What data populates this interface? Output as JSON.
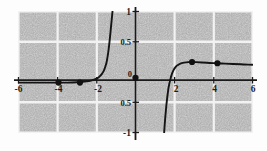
{
  "figure": {
    "title": "",
    "background_color": "#ffffff",
    "plot_background_color": "#a9a9a9",
    "grid_color": "#ffffff",
    "axis_color": "#1a1a1a",
    "curve_color": "#1a1a1a",
    "point_color": "#111111"
  },
  "chart_data": {
    "type": "line",
    "title": "",
    "subtitle": "",
    "xlabel": "",
    "ylabel": "",
    "xlim": [
      -6,
      6
    ],
    "ylim": [
      -1,
      1
    ],
    "grid": true,
    "grid_x_lines": [
      -6,
      -4,
      -2,
      0,
      2,
      4,
      6
    ],
    "grid_y_lines": [
      -1,
      -0.5,
      0,
      0.5,
      1
    ],
    "legend": null,
    "legend_position": "none",
    "xticks": [
      -6,
      -4,
      -2,
      2,
      4,
      6
    ],
    "xtick_labels": [
      "-6",
      "-4",
      "-2",
      "2",
      "4",
      "6"
    ],
    "yticks": [
      -1,
      -0.5,
      0.5,
      1
    ],
    "ytick_labels": [
      "-1",
      "0.5",
      "0.5",
      "1"
    ],
    "origin_label": "0",
    "vertical_asymptotes": [
      -1.15,
      1.45
    ],
    "series": [
      {
        "name": "branch-left",
        "comment": "left branch: flat near y=-0.17 from x=-6, rising steeply to +1 at asymptote x=-1.15",
        "x": [
          -6.0,
          -5.5,
          -5.0,
          -4.5,
          -4.0,
          -3.5,
          -3.0,
          -2.8,
          -2.6,
          -2.4,
          -2.2,
          -2.0,
          -1.9,
          -1.8,
          -1.7,
          -1.6,
          -1.5,
          -1.45,
          -1.4,
          -1.35,
          -1.3,
          -1.27,
          -1.24,
          -1.21,
          -1.18
        ],
        "y": [
          -0.175,
          -0.175,
          -0.175,
          -0.175,
          -0.175,
          -0.175,
          -0.17,
          -0.165,
          -0.16,
          -0.15,
          -0.135,
          -0.11,
          -0.09,
          -0.06,
          -0.02,
          0.04,
          0.14,
          0.22,
          0.32,
          0.45,
          0.6,
          0.7,
          0.8,
          0.9,
          1.0
        ]
      },
      {
        "name": "branch-right",
        "comment": "right branch: from -1 at asymptote x=1.45 rising to plateau y~0.16 then slow decay to y~0.12 at x=6",
        "x": [
          1.47,
          1.5,
          1.54,
          1.58,
          1.62,
          1.66,
          1.7,
          1.78,
          1.86,
          1.95,
          2.05,
          2.15,
          2.3,
          2.5,
          2.7,
          2.9,
          3.1,
          3.4,
          3.8,
          4.2,
          4.6,
          5.0,
          5.4,
          5.8,
          6.0
        ],
        "y": [
          -1.0,
          -0.86,
          -0.7,
          -0.56,
          -0.44,
          -0.34,
          -0.25,
          -0.13,
          -0.04,
          0.03,
          0.08,
          0.11,
          0.14,
          0.155,
          0.163,
          0.165,
          0.163,
          0.158,
          0.15,
          0.145,
          0.138,
          0.132,
          0.127,
          0.122,
          0.12
        ]
      }
    ],
    "marked_points": [
      {
        "label": "",
        "x": -3.95,
        "y": -0.175
      },
      {
        "label": "",
        "x": -2.85,
        "y": -0.175
      },
      {
        "label": "",
        "x": 0.0,
        "y": -0.095
      },
      {
        "label": "",
        "x": 2.9,
        "y": 0.165
      },
      {
        "label": "",
        "x": 4.2,
        "y": 0.145
      }
    ],
    "annotations": []
  }
}
